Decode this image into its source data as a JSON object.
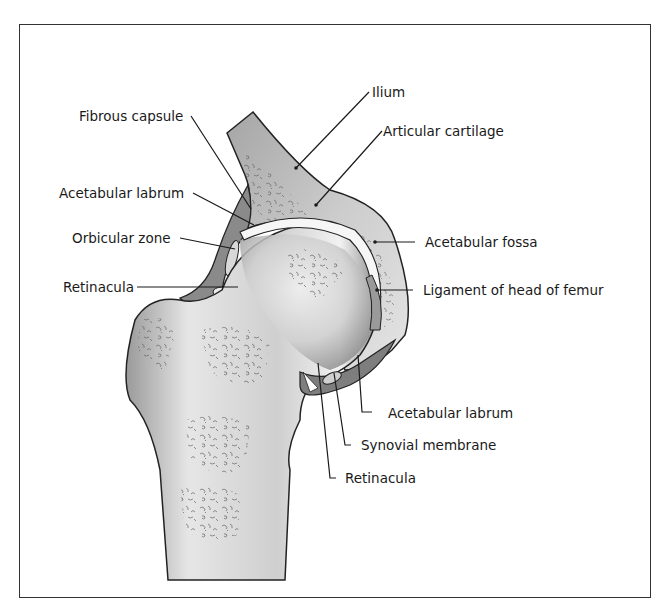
{
  "figure": {
    "labels": {
      "fibrous_capsule": "Fibrous capsule",
      "acetabular_labrum_left": "Acetabular labrum",
      "orbicular_zone": "Orbicular zone",
      "retinacula_left": "Retinacula",
      "ilium": "Ilium",
      "articular_cartilage": "Articular cartilage",
      "acetabular_fossa": "Acetabular fossa",
      "ligament_head_femur": "Ligament of head of femur",
      "acetabular_labrum_right": "Acetabular labrum",
      "synovial_membrane": "Synovial membrane",
      "retinacula_bottom": "Retinacula"
    },
    "colors": {
      "frame": "#333333",
      "bone_light": "#e8e8e8",
      "bone_mid": "#bdbdbd",
      "bone_dark": "#8a8a8a",
      "capsule": "#7a7a7a",
      "cartilage": "#f4f4f4",
      "line": "#1a1a1a"
    }
  }
}
